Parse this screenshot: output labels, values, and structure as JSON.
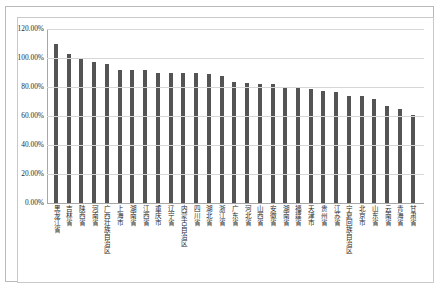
{
  "chart_data": {
    "type": "bar",
    "title": "",
    "xlabel": "",
    "ylabel": "",
    "ylim": [
      0,
      1.2
    ],
    "grid": true,
    "legend": null,
    "y_tick_labels": [
      "120.00%",
      "100.00%",
      "80.00%",
      "60.00%",
      "40.00%",
      "20.00%",
      "0.00%"
    ],
    "y_tick_values": [
      1.2,
      1.0,
      0.8,
      0.6,
      0.4,
      0.2,
      0.0
    ],
    "bar_color": "#545454",
    "categories": [
      "黑龙江省",
      "吉林省",
      "陕西省",
      "河南省",
      "广西壮族自治区",
      "上海市",
      "湖南省",
      "江西省",
      "重庆市",
      "辽宁省",
      "内蒙古自治区",
      "四川省",
      "湖北省",
      "浙江省",
      "广东省",
      "河北省",
      "山西省",
      "安徽省",
      "湖南省",
      "福建省",
      "天津市",
      "贵州省",
      "江苏省",
      "宁夏回族自治区",
      "北京市",
      "山东省",
      "云南省",
      "青海省",
      "甘肃省"
    ],
    "values": [
      1.1,
      1.03,
      0.995,
      0.97,
      0.96,
      0.92,
      0.92,
      0.915,
      0.9,
      0.895,
      0.895,
      0.895,
      0.888,
      0.878,
      0.835,
      0.825,
      0.82,
      0.82,
      0.795,
      0.79,
      0.785,
      0.775,
      0.765,
      0.74,
      0.735,
      0.715,
      0.67,
      0.645,
      0.605
    ],
    "value_labels": [
      "110.00%",
      "103.00%",
      "99.50%",
      "97.00%",
      "96.00%",
      "92.00%",
      "92.00%",
      "91.50%",
      "90.00%",
      "89.50%",
      "89.50%",
      "89.50%",
      "88.80%",
      "87.80%",
      "83.50%",
      "82.50%",
      "82.00%",
      "82.00%",
      "79.50%",
      "79.00%",
      "78.50%",
      "77.50%",
      "76.50%",
      "74.00%",
      "73.50%",
      "71.50%",
      "67.00%",
      "64.50%",
      "60.50%"
    ]
  }
}
